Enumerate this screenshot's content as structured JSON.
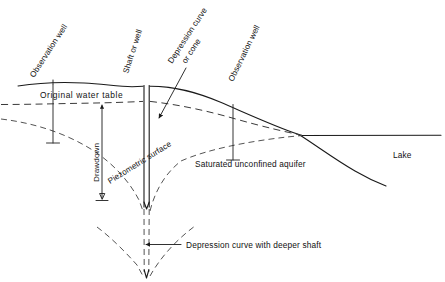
{
  "figure": {
    "domain": "diagram",
    "background_color": "#ffffff",
    "line_color": "#1a1a1a",
    "width": 445,
    "height": 282
  },
  "labels": {
    "observation_well_left": "Observation well",
    "shaft_or_well": "Shaft or well",
    "depression_curve_line1": "Depression curve",
    "depression_curve_line2": "or cone",
    "observation_well_right": "Observation well",
    "original_water_table": "Original water table",
    "drawdown": "Drawdown",
    "piezometric_surface": "Piezometric surface",
    "saturated_unconfined_aquifer": "Saturated unconfined aquifer",
    "depression_curve_deeper_shaft": "Depression curve with deeper shaft",
    "lake": "Lake"
  },
  "geometry": {
    "ground_surface": "M 18,86 C 40,83 62,82 84,83 C 104,84 118,86 132,87 L 144,86 C 168,85 190,92 212,101 C 240,112 268,125 296,134 L 312,138",
    "ground_surface_right_of_shaft": "M 152,86 C 176,86 198,93 220,102 C 248,114 276,127 300,135",
    "lake_surface": "M 306,137 L 440,137",
    "lake_bed": "M 300,134 C 318,146 336,160 356,172 C 368,179 378,183 386,186",
    "original_water_table_dashed": "M 2,104 C 30,104 58,103 86,103 C 110,103 128,102 144,101",
    "water_table_right_dashed": "M 152,101 C 178,104 206,110 234,118 C 262,126 288,132 306,136",
    "depression_curve_left": "M 2,120 C 36,124 68,134 96,152 C 116,165 130,181 140,200 L 143,210",
    "depression_curve_right": "M 146,210 C 152,192 162,174 178,160 C 206,148 250,141 288,137 L 306,136",
    "deep_shaft_curve_left": "M 98,228 C 112,238 126,252 138,266 L 143,276",
    "deep_shaft_curve_right": "M 148,276 C 160,258 176,240 194,226",
    "shaft_wall_left": "M 144,86 L 144,206",
    "shaft_wall_right": "M 149,86 L 149,206",
    "shaft_deep_left_dashed": "M 144,206 L 144,274",
    "shaft_deep_right_dashed": "M 149,206 L 148,274",
    "obs_well_left_x": 53,
    "obs_well_left_top": 85,
    "obs_well_left_bottom": 143,
    "obs_well_right_x": 233,
    "obs_well_right_top": 105,
    "obs_well_right_bottom": 160,
    "drawdown_arrow_x": 102,
    "drawdown_arrow_top": 103,
    "drawdown_arrow_bottom": 200
  },
  "label_placement": {
    "observation_well_left": {
      "x": 34,
      "y": 76,
      "rotate": -57
    },
    "shaft_or_well": {
      "x": 126,
      "y": 72,
      "rotate": -70
    },
    "depression_curve_line1": {
      "x": 174,
      "y": 62,
      "rotate": -58
    },
    "depression_curve_line2": {
      "x": 192,
      "y": 62,
      "rotate": -58
    },
    "observation_well_right": {
      "x": 233,
      "y": 78,
      "rotate": -62
    },
    "original_water_table": {
      "x": 40,
      "y": 98
    },
    "drawdown": {
      "x": 99,
      "y": 180,
      "rotate": -90
    },
    "piezometric_surface": {
      "x": 112,
      "y": 182,
      "rotate": -33
    },
    "saturated_unconfined_aquifer": {
      "x": 195,
      "y": 167
    },
    "depression_curve_deeper_shaft": {
      "x": 185,
      "y": 247
    },
    "lake": {
      "x": 393,
      "y": 157
    }
  }
}
